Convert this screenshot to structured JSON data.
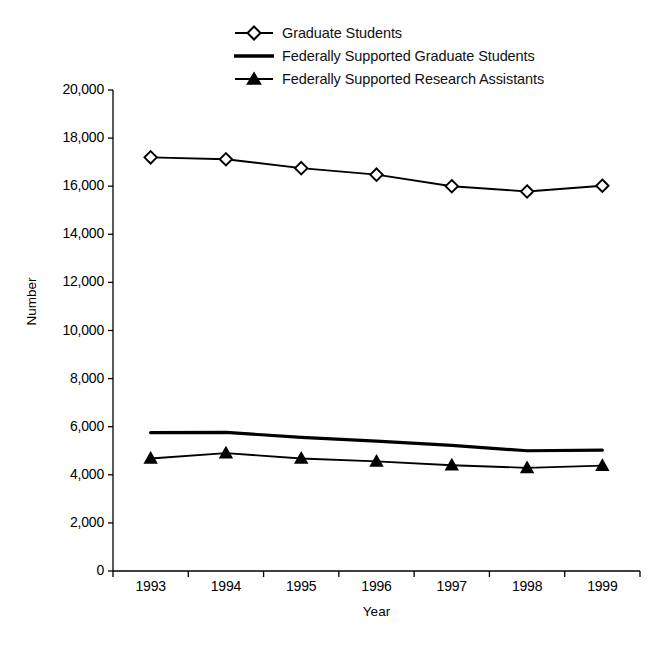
{
  "chart_data": {
    "type": "line",
    "title": "",
    "xlabel": "Year",
    "ylabel": "Number",
    "categories": [
      "1993",
      "1994",
      "1995",
      "1996",
      "1997",
      "1998",
      "1999"
    ],
    "ylim": [
      0,
      20000
    ],
    "ytick_labels": [
      "20,000",
      "18,000",
      "16,000",
      "14,000",
      "12,000",
      "10,000",
      "8,000",
      "6,000",
      "4,000",
      "2,000",
      "0"
    ],
    "ytick_values": [
      20000,
      18000,
      16000,
      14000,
      12000,
      10000,
      8000,
      6000,
      4000,
      2000,
      0
    ],
    "grid": false,
    "legend_position": "top-center",
    "series": [
      {
        "name": "Graduate Students",
        "marker": "open-diamond",
        "values": [
          17200,
          17120,
          16750,
          16480,
          16000,
          15780,
          16020
        ]
      },
      {
        "name": "Federally Supported Graduate Students",
        "marker": "none",
        "values": [
          5750,
          5760,
          5560,
          5400,
          5220,
          5000,
          5030
        ]
      },
      {
        "name": "Federally Supported Research Assistants",
        "marker": "filled-triangle",
        "values": [
          4680,
          4900,
          4680,
          4560,
          4400,
          4290,
          4380
        ]
      }
    ]
  },
  "legend": {
    "items": [
      {
        "label": "Graduate Students",
        "key": "line-open-diamond"
      },
      {
        "label": "Federally Supported Graduate Students",
        "key": "line-plain"
      },
      {
        "label": "Federally Supported Research Assistants",
        "key": "line-filled-triangle"
      }
    ]
  },
  "axes": {
    "y_title": "Number",
    "x_title": "Year"
  }
}
